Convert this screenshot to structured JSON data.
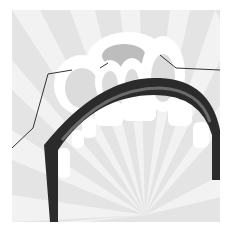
{
  "illustration": {
    "subject": "stylized open mouth with teeth over sunburst background",
    "colors": {
      "background": "#ffffff",
      "panel": "#e2e2e2",
      "ray_light": "#efefef",
      "ray_dark": "#d6d6d6",
      "teeth": "#ffffff",
      "tooth_shadow": "#bdbdbd",
      "lip_dark": "#2b2b2b",
      "lip_mid": "#4a4a4a",
      "lip_highlight": "#7a7a7a",
      "line": "#333333"
    }
  }
}
